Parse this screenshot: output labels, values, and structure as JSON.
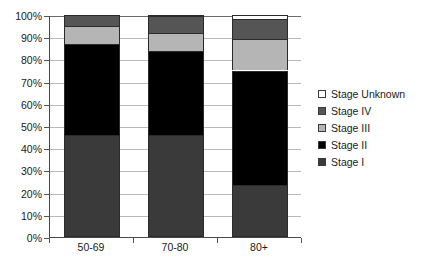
{
  "chart_data": {
    "type": "bar",
    "subtype": "stacked-percent-column",
    "title": "",
    "subtitle": "",
    "xlabel": "",
    "ylabel": "",
    "categories": [
      "50-69",
      "70-80",
      "80+"
    ],
    "ylim": [
      0,
      100
    ],
    "y_ticks": [
      "0%",
      "10%",
      "20%",
      "30%",
      "40%",
      "50%",
      "60%",
      "70%",
      "80%",
      "90%",
      "100%"
    ],
    "y_tick_values": [
      0,
      10,
      20,
      30,
      40,
      50,
      60,
      70,
      80,
      90,
      100
    ],
    "grid": true,
    "legend_position": "right",
    "stack_order_bottom_to_top": [
      "Stage I",
      "Stage II",
      "Stage III",
      "Stage IV",
      "Stage Unknown"
    ],
    "series": [
      {
        "name": "Stage I",
        "color": "#3a3a3a",
        "values": [
          46.0,
          46.0,
          23.5
        ]
      },
      {
        "name": "Stage II",
        "color": "#000000",
        "values": [
          41.0,
          38.0,
          51.5
        ]
      },
      {
        "name": "Stage III",
        "color": "#b5b5b5",
        "values": [
          8.0,
          8.0,
          14.0
        ]
      },
      {
        "name": "Stage IV",
        "color": "#555555",
        "values": [
          5.0,
          7.5,
          9.0
        ]
      },
      {
        "name": "Stage Unknown",
        "color": "#ffffff",
        "values": [
          0.0,
          0.5,
          2.0
        ]
      }
    ],
    "cumulative_tops": {
      "50-69": [
        46.0,
        87.0,
        95.0,
        100.0,
        100.0
      ],
      "70-80": [
        46.0,
        84.0,
        92.0,
        99.5,
        100.0
      ],
      "80+": [
        23.5,
        75.0,
        89.0,
        98.0,
        100.0
      ]
    }
  },
  "legend": {
    "items": [
      {
        "label": "Stage Unknown",
        "color": "#ffffff"
      },
      {
        "label": "Stage IV",
        "color": "#555555"
      },
      {
        "label": "Stage III",
        "color": "#b5b5b5"
      },
      {
        "label": "Stage II",
        "color": "#000000"
      },
      {
        "label": "Stage I",
        "color": "#3a3a3a"
      }
    ]
  },
  "axes": {
    "y_ticks": [
      "100%",
      "90%",
      "80%",
      "70%",
      "60%",
      "50%",
      "40%",
      "30%",
      "20%",
      "10%",
      "0%"
    ],
    "x_ticks": [
      "50-69",
      "70-80",
      "80+"
    ]
  }
}
